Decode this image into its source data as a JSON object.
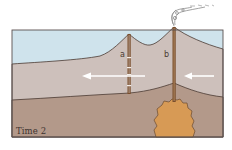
{
  "diagram": {
    "type": "geologic cross-section",
    "panel_label": "Time 2",
    "column_labels": {
      "a": "a",
      "b": "b"
    },
    "layers": [
      {
        "name": "sky",
        "color": "#cfe3ec"
      },
      {
        "name": "upper-rock-layer",
        "color": "#cdc0bb"
      },
      {
        "name": "lower-rock-layer",
        "color": "#b3998a"
      },
      {
        "name": "magma-chamber",
        "color": "#d79a55"
      }
    ],
    "features": {
      "volcano_a": "extinct volcano with dashed conduit (column a)",
      "volcano_b": "active volcano emitting smoke, conduit connected to magma chamber (column b)",
      "arrows": [
        "plate motion arrow pointing left (left of b)",
        "plate motion arrow pointing left (right of b)"
      ]
    },
    "colors": {
      "outline": "#4a3a32",
      "conduit": "#7a4e2c",
      "arrow": "#ffffff",
      "smoke": "#8a8a8a"
    }
  }
}
